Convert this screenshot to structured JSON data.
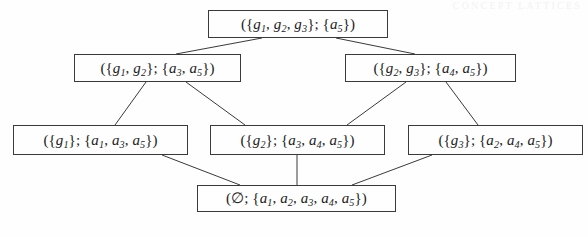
{
  "figure": {
    "kind": "hasse-diagram",
    "background_color": "#fefefe",
    "line_color": "#3a3a3a",
    "text_color": "#1c1c1c",
    "width": 588,
    "height": 236
  },
  "running_header": {
    "text": "CONCEPT LATTICES",
    "color": "#f2f2f4"
  },
  "nodes": [
    {
      "id": "top",
      "level": 0,
      "label": "({g1, g2, g3}; {a5})",
      "objects": [
        "g1",
        "g2",
        "g3"
      ],
      "attributes": [
        "a5"
      ],
      "x": 208,
      "y": 10,
      "w": 180,
      "h": 28
    },
    {
      "id": "n-g1g2",
      "level": 1,
      "label": "({g1, g2}; {a3, a5})",
      "objects": [
        "g1",
        "g2"
      ],
      "attributes": [
        "a3",
        "a5"
      ],
      "x": 74,
      "y": 54,
      "w": 167,
      "h": 28
    },
    {
      "id": "n-g2g3",
      "level": 1,
      "label": "({g2, g3}; {a4, a5})",
      "objects": [
        "g2",
        "g3"
      ],
      "attributes": [
        "a4",
        "a5"
      ],
      "x": 345,
      "y": 54,
      "w": 171,
      "h": 28
    },
    {
      "id": "n-g1",
      "level": 2,
      "label": "({g1}; {a1, a3, a5})",
      "objects": [
        "g1"
      ],
      "attributes": [
        "a1",
        "a3",
        "a5"
      ],
      "x": 13,
      "y": 125,
      "w": 175,
      "h": 30
    },
    {
      "id": "n-g2",
      "level": 2,
      "label": "({g2}; {a3, a4, a5})",
      "objects": [
        "g2"
      ],
      "attributes": [
        "a3",
        "a4",
        "a5"
      ],
      "x": 210,
      "y": 125,
      "w": 175,
      "h": 30
    },
    {
      "id": "n-g3",
      "level": 2,
      "label": "({g3}; {a2, a4, a5})",
      "objects": [
        "g3"
      ],
      "attributes": [
        "a2",
        "a4",
        "a5"
      ],
      "x": 408,
      "y": 125,
      "w": 175,
      "h": 30
    },
    {
      "id": "bottom",
      "level": 3,
      "label": "(0; {a1, a2, a3, a4, a5})",
      "objects": [],
      "attributes": [
        "a1",
        "a2",
        "a3",
        "a4",
        "a5"
      ],
      "x": 197,
      "y": 185,
      "w": 199,
      "h": 27
    }
  ],
  "edges": [
    {
      "from": "top",
      "to": "n-g1g2",
      "x1": 262,
      "y1": 38,
      "x2": 176,
      "y2": 54
    },
    {
      "from": "top",
      "to": "n-g2g3",
      "x1": 336,
      "y1": 38,
      "x2": 415,
      "y2": 54
    },
    {
      "from": "n-g1g2",
      "to": "n-g1",
      "x1": 146,
      "y1": 82,
      "x2": 115,
      "y2": 125
    },
    {
      "from": "n-g1g2",
      "to": "n-g2",
      "x1": 186,
      "y1": 82,
      "x2": 245,
      "y2": 125
    },
    {
      "from": "n-g2g3",
      "to": "n-g2",
      "x1": 406,
      "y1": 82,
      "x2": 347,
      "y2": 125
    },
    {
      "from": "n-g2g3",
      "to": "n-g3",
      "x1": 446,
      "y1": 82,
      "x2": 478,
      "y2": 125
    },
    {
      "from": "n-g1",
      "to": "bottom",
      "x1": 162,
      "y1": 155,
      "x2": 240,
      "y2": 185
    },
    {
      "from": "n-g2",
      "to": "bottom",
      "x1": 297,
      "y1": 155,
      "x2": 297,
      "y2": 185
    },
    {
      "from": "n-g3",
      "to": "bottom",
      "x1": 432,
      "y1": 155,
      "x2": 352,
      "y2": 185
    }
  ]
}
